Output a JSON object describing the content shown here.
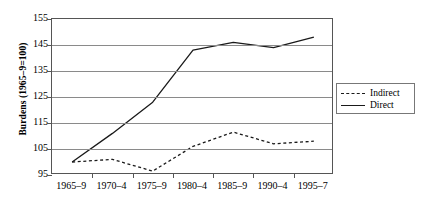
{
  "chart_data": {
    "type": "line",
    "title": "",
    "xlabel": "",
    "ylabel": "Burdens (1965–9=100)",
    "categories": [
      "1965–9",
      "1970–4",
      "1975–9",
      "1980–4",
      "1985–9",
      "1990–4",
      "1995–7"
    ],
    "series": [
      {
        "name": "Indirect",
        "style": "dashed",
        "color": "#1a1a1a",
        "values": [
          100,
          101,
          96.5,
          106,
          111.5,
          107,
          108
        ]
      },
      {
        "name": "Direct",
        "style": "solid",
        "color": "#1a1a1a",
        "values": [
          100,
          111,
          123,
          143,
          146,
          144,
          148
        ]
      }
    ],
    "ylim": [
      95,
      155
    ],
    "yticks": [
      95,
      105,
      115,
      125,
      135,
      145,
      155
    ],
    "ytick_labels": [
      "95",
      "105",
      "115",
      "125",
      "135",
      "145",
      "155"
    ],
    "grid": true,
    "legend_position": "right"
  },
  "legend": {
    "items": [
      {
        "label": "Indirect",
        "swatch": "dashed-line-swatch"
      },
      {
        "label": "Direct",
        "swatch": "solid-line-swatch"
      }
    ]
  }
}
